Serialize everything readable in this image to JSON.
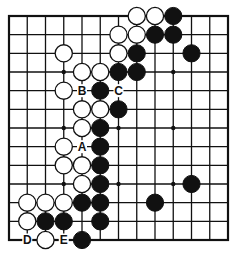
{
  "diagram": {
    "type": "go-board",
    "size": 13,
    "colors": {
      "line": "#111111",
      "black_stone": "#111111",
      "white_stone": "#ffffff",
      "background": "#ffffff"
    },
    "star_points": [
      [
        3,
        3
      ],
      [
        9,
        3
      ],
      [
        3,
        6
      ],
      [
        6,
        6
      ],
      [
        9,
        6
      ],
      [
        3,
        9
      ],
      [
        6,
        9
      ],
      [
        9,
        9
      ]
    ],
    "white_stones": [
      [
        7,
        0
      ],
      [
        8,
        0
      ],
      [
        6,
        1
      ],
      [
        7,
        1
      ],
      [
        3,
        2
      ],
      [
        6,
        2
      ],
      [
        4,
        3
      ],
      [
        5,
        3
      ],
      [
        3,
        4
      ],
      [
        4,
        5
      ],
      [
        5,
        5
      ],
      [
        4,
        6
      ],
      [
        3,
        7
      ],
      [
        3,
        8
      ],
      [
        4,
        8
      ],
      [
        4,
        9
      ],
      [
        1,
        10
      ],
      [
        2,
        10
      ],
      [
        3,
        10
      ],
      [
        1,
        11
      ],
      [
        2,
        12
      ]
    ],
    "black_stones": [
      [
        9,
        0
      ],
      [
        8,
        1
      ],
      [
        9,
        1
      ],
      [
        7,
        2
      ],
      [
        10,
        2
      ],
      [
        6,
        3
      ],
      [
        7,
        3
      ],
      [
        5,
        4
      ],
      [
        6,
        5
      ],
      [
        5,
        6
      ],
      [
        5,
        7
      ],
      [
        5,
        8
      ],
      [
        5,
        9
      ],
      [
        10,
        9
      ],
      [
        4,
        10
      ],
      [
        5,
        10
      ],
      [
        8,
        10
      ],
      [
        2,
        11
      ],
      [
        3,
        11
      ],
      [
        5,
        11
      ],
      [
        4,
        12
      ]
    ],
    "labels": [
      {
        "text": "A",
        "col": 4,
        "row": 7
      },
      {
        "text": "B",
        "col": 4,
        "row": 4
      },
      {
        "text": "C",
        "col": 6,
        "row": 4
      },
      {
        "text": "D",
        "col": 1,
        "row": 12
      },
      {
        "text": "E",
        "col": 3,
        "row": 12
      }
    ]
  }
}
